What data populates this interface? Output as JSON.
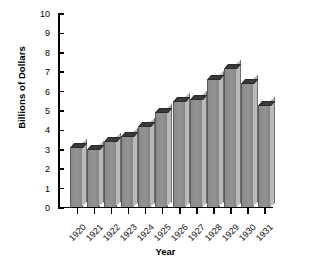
{
  "chart_data": {
    "type": "bar",
    "title": "",
    "xlabel": "Year",
    "ylabel": "Billions of Dollars",
    "categories": [
      "1920",
      "1921",
      "1922",
      "1923",
      "1924",
      "1925",
      "1926",
      "1927",
      "1928",
      "1929",
      "1930",
      "1931"
    ],
    "values": [
      3.0,
      2.9,
      3.3,
      3.6,
      4.1,
      4.8,
      5.4,
      5.5,
      6.5,
      7.1,
      6.3,
      5.2
    ],
    "ylim": [
      0,
      10
    ],
    "ytick_values": [
      0,
      1,
      2,
      3,
      4,
      5,
      6,
      7,
      8,
      9,
      10
    ],
    "ytick_labels": [
      "0",
      "1",
      "2",
      "3",
      "4",
      "5",
      "6",
      "7",
      "8",
      "9",
      "10"
    ],
    "grid": false,
    "legend": null,
    "bar_style": "3d-block",
    "colors": {
      "bar_front": "#8d8d8d",
      "bar_top": "#3a3a3a",
      "bar_side": "#b9b9b9",
      "axis": "#000000",
      "background": "#ffffff",
      "text": "#000000"
    }
  }
}
